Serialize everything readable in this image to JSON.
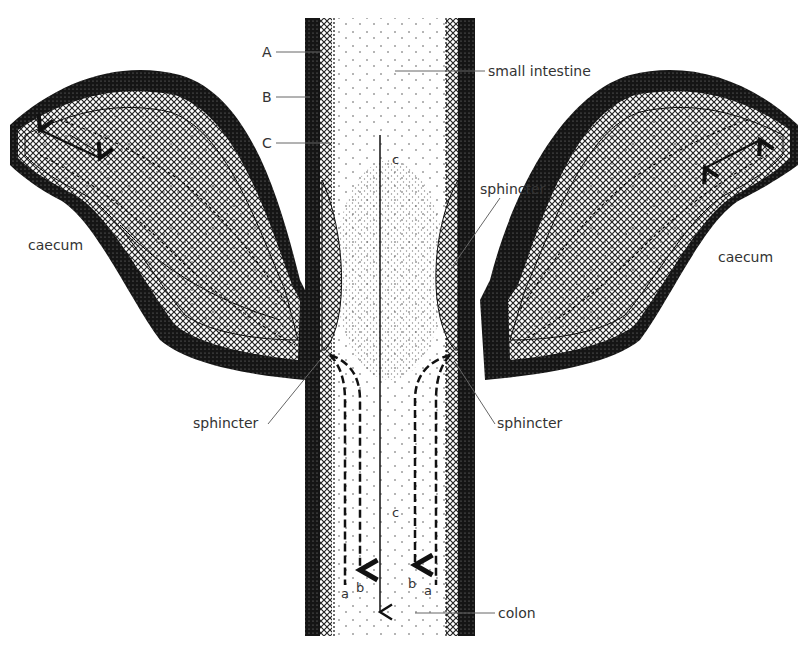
{
  "diagram": {
    "type": "anatomical cross-section",
    "labels": {
      "layer_a": "A",
      "layer_b": "B",
      "layer_c": "C",
      "small_intestine": "small intestine",
      "caecum_left": "caecum",
      "caecum_right": "caecum",
      "sphincter_upper_right": "sphincter",
      "sphincter_lower_left": "sphincter",
      "sphincter_lower_right": "sphincter",
      "colon": "colon",
      "flow_a_left": "a",
      "flow_b_left": "b",
      "flow_c_upper": "c",
      "flow_c_lower": "c",
      "flow_b_right": "b",
      "flow_a_right": "a"
    },
    "colors": {
      "outer_wall": "#1a1a1a",
      "hatch_layer": "#444444",
      "lumen": "#ffffff",
      "leader_lines": "#666666"
    }
  }
}
